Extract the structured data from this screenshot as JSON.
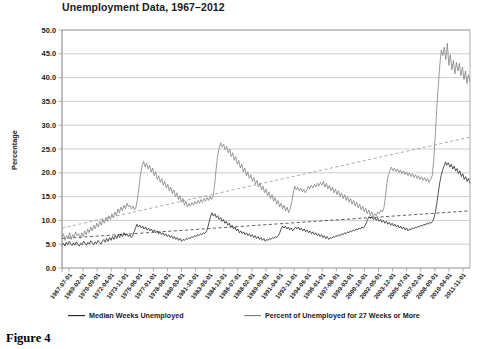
{
  "figure": {
    "caption": "Figure 4"
  },
  "chart_data": {
    "type": "line",
    "title": "Unemployment Data, 1967–2012",
    "xlabel": "",
    "ylabel": "Percentage",
    "ylim": [
      0.0,
      50.0
    ],
    "yticks": [
      "0.0",
      "5.0",
      "10.0",
      "15.0",
      "20.0",
      "25.0",
      "30.0",
      "35.0",
      "40.0",
      "45.0",
      "50.0"
    ],
    "ytick_values": [
      0,
      5,
      10,
      15,
      20,
      25,
      30,
      35,
      40,
      45,
      50
    ],
    "grid": true,
    "legend_position": "bottom",
    "legend": [
      "Median Weeks Unemployed",
      "Percent of Unemployed for 27 Weeks or More"
    ],
    "xtick_labels": [
      "1967-07-01",
      "1969-02-01",
      "1970-09-01",
      "1972-04-01",
      "1973-11-01",
      "1975-06-01",
      "1977-01-01",
      "1978-08-01",
      "1980-03-01",
      "1981-10-01",
      "1983-05-01",
      "1984-12-01",
      "1986-07-01",
      "1988-02-01",
      "1989-09-01",
      "1991-04-01",
      "1992-11-01",
      "1994-06-01",
      "1996-01-01",
      "1997-08-01",
      "1999-03-01",
      "2000-10-01",
      "2002-05-01",
      "2003-12-01",
      "2005-07-01",
      "2007-02-01",
      "2008-09-01",
      "2010-04-01",
      "2011-11-01"
    ],
    "xtick_interval_months": 19,
    "x_start": "1967-07-01",
    "x_end": "2012-06-01",
    "colors": {
      "median": "#1d1d1d",
      "percent": "#7b7b7b",
      "grid": "#b9b9b9"
    },
    "series": [
      {
        "name": "Median Weeks Unemployed",
        "color": "#1d1d1d",
        "trend_endpoints": [
          6.2,
          12.0
        ],
        "values": [
          4.8,
          5.2,
          4.6,
          5.4,
          4.9,
          5.6,
          5.1,
          4.7,
          5.3,
          4.8,
          5.5,
          5.0,
          4.6,
          5.2,
          4.9,
          5.6,
          5.2,
          4.8,
          5.4,
          5.0,
          5.7,
          5.3,
          4.9,
          5.5,
          5.1,
          5.8,
          5.4,
          5.0,
          5.6,
          6.0,
          5.4,
          6.2,
          5.6,
          6.4,
          5.8,
          6.6,
          6.0,
          6.8,
          6.2,
          7.0,
          6.4,
          7.2,
          6.6,
          7.4,
          6.8,
          7.2,
          6.6,
          7.0,
          6.4,
          6.8,
          7.6,
          8.4,
          9.2,
          8.6,
          9.0,
          8.4,
          8.8,
          8.2,
          8.6,
          8.0,
          8.4,
          7.8,
          8.2,
          7.6,
          8.0,
          7.4,
          7.8,
          7.2,
          7.6,
          7.0,
          7.4,
          6.8,
          7.2,
          6.6,
          7.0,
          6.4,
          6.8,
          6.2,
          6.6,
          6.0,
          6.4,
          5.8,
          6.2,
          5.6,
          6.0,
          5.8,
          6.2,
          6.0,
          6.4,
          6.2,
          6.6,
          6.4,
          6.8,
          6.6,
          7.0,
          6.8,
          7.2,
          7.0,
          7.4,
          7.2,
          7.6,
          8.4,
          9.6,
          10.8,
          11.6,
          10.9,
          11.4,
          10.6,
          11.0,
          10.2,
          10.6,
          9.8,
          10.2,
          9.4,
          9.8,
          9.0,
          9.4,
          8.6,
          9.0,
          8.2,
          8.6,
          7.8,
          8.2,
          7.4,
          7.8,
          7.2,
          7.6,
          7.0,
          7.4,
          6.8,
          7.2,
          6.6,
          7.0,
          6.4,
          6.8,
          6.2,
          6.6,
          6.0,
          6.4,
          5.8,
          6.2,
          5.6,
          6.0,
          5.8,
          6.2,
          6.0,
          6.4,
          6.2,
          6.6,
          6.4,
          6.8,
          7.4,
          8.2,
          8.8,
          8.4,
          8.8,
          8.2,
          8.6,
          8.0,
          8.4,
          7.8,
          8.2,
          8.6,
          8.2,
          8.6,
          8.0,
          8.4,
          7.8,
          8.2,
          7.6,
          8.0,
          7.4,
          7.8,
          7.2,
          7.6,
          7.0,
          7.4,
          6.8,
          7.2,
          6.6,
          7.0,
          6.4,
          6.8,
          6.2,
          6.6,
          6.0,
          6.4,
          6.2,
          6.6,
          6.4,
          6.8,
          6.6,
          7.0,
          6.8,
          7.2,
          7.0,
          7.4,
          7.2,
          7.6,
          7.4,
          7.8,
          7.6,
          8.0,
          7.8,
          8.2,
          8.0,
          8.4,
          8.2,
          8.6,
          8.4,
          8.8,
          9.4,
          10.2,
          10.8,
          10.4,
          10.8,
          10.2,
          10.6,
          10.0,
          10.4,
          9.8,
          10.2,
          9.6,
          10.0,
          9.4,
          9.8,
          9.2,
          9.6,
          9.0,
          9.4,
          8.8,
          9.2,
          8.6,
          9.0,
          8.4,
          8.8,
          8.2,
          8.6,
          8.0,
          8.4,
          7.8,
          8.2,
          8.0,
          8.4,
          8.2,
          8.6,
          8.4,
          8.8,
          8.6,
          9.0,
          8.8,
          9.2,
          9.0,
          9.4,
          9.2,
          9.6,
          9.4,
          9.8,
          10.4,
          11.8,
          13.6,
          15.8,
          17.9,
          19.4,
          20.6,
          21.4,
          22.3,
          21.6,
          22.1,
          21.2,
          21.8,
          20.8,
          21.4,
          20.4,
          20.9,
          19.8,
          20.4,
          19.2,
          19.8,
          18.6,
          19.2,
          18.2,
          18.8,
          17.8
        ]
      },
      {
        "name": "Percent of Unemployed for 27 Weeks or More",
        "color": "#7b7b7b",
        "trend_endpoints": [
          8.4,
          27.5
        ],
        "values": [
          6.4,
          7.2,
          5.8,
          6.8,
          6.2,
          7.4,
          6.0,
          7.0,
          6.4,
          7.6,
          6.8,
          7.2,
          6.2,
          7.4,
          6.6,
          7.8,
          7.0,
          8.2,
          7.4,
          8.6,
          7.8,
          9.0,
          8.2,
          9.4,
          8.6,
          9.8,
          9.0,
          10.2,
          9.4,
          10.6,
          9.8,
          11.0,
          10.2,
          11.4,
          10.6,
          11.8,
          11.0,
          12.4,
          11.6,
          12.8,
          12.0,
          13.2,
          12.4,
          13.6,
          12.8,
          13.2,
          12.4,
          13.0,
          12.2,
          12.8,
          14.6,
          17.2,
          19.8,
          21.4,
          22.4,
          21.2,
          22.0,
          20.8,
          21.6,
          20.2,
          21.0,
          19.4,
          20.2,
          18.6,
          19.4,
          18.0,
          18.8,
          17.4,
          18.2,
          16.8,
          17.6,
          16.2,
          17.0,
          15.6,
          16.4,
          15.0,
          15.8,
          14.4,
          15.2,
          13.8,
          14.6,
          13.2,
          14.0,
          12.8,
          13.6,
          13.0,
          13.8,
          13.2,
          14.0,
          13.4,
          14.2,
          13.6,
          14.4,
          13.8,
          14.6,
          14.0,
          14.8,
          14.2,
          15.0,
          14.4,
          15.2,
          17.4,
          20.8,
          23.6,
          25.2,
          26.3,
          25.4,
          26.0,
          24.8,
          25.6,
          24.2,
          25.0,
          23.4,
          24.2,
          22.6,
          23.4,
          21.8,
          22.6,
          21.0,
          21.8,
          20.2,
          21.0,
          19.4,
          20.2,
          18.8,
          19.6,
          18.2,
          19.0,
          17.6,
          18.4,
          17.0,
          17.8,
          16.4,
          17.2,
          15.8,
          16.6,
          15.2,
          16.0,
          14.6,
          15.4,
          14.0,
          14.8,
          13.4,
          14.2,
          12.8,
          13.6,
          12.4,
          13.2,
          12.0,
          12.8,
          11.6,
          12.4,
          13.8,
          15.6,
          17.2,
          16.4,
          17.0,
          16.2,
          16.8,
          16.0,
          16.6,
          15.8,
          16.4,
          17.2,
          16.6,
          17.4,
          16.8,
          17.6,
          17.0,
          17.8,
          17.2,
          18.0,
          17.4,
          18.2,
          17.0,
          17.8,
          16.6,
          17.4,
          16.2,
          17.0,
          15.8,
          16.6,
          15.4,
          16.2,
          15.0,
          15.8,
          14.6,
          15.4,
          14.2,
          15.0,
          13.8,
          14.6,
          13.4,
          14.2,
          13.0,
          13.8,
          12.6,
          13.4,
          12.2,
          13.0,
          11.8,
          12.6,
          11.4,
          12.2,
          11.0,
          11.8,
          10.6,
          11.4,
          11.0,
          11.8,
          11.4,
          12.2,
          11.8,
          12.6,
          14.8,
          17.8,
          19.6,
          20.4,
          21.2,
          20.4,
          21.0,
          20.2,
          20.8,
          20.0,
          20.6,
          19.8,
          20.4,
          19.6,
          20.2,
          19.4,
          20.0,
          19.2,
          19.8,
          19.0,
          19.6,
          18.8,
          19.4,
          18.6,
          19.2,
          18.4,
          19.0,
          18.2,
          18.8,
          18.0,
          18.6,
          19.4,
          22.6,
          27.8,
          33.4,
          38.2,
          42.6,
          45.8,
          44.6,
          46.4,
          43.8,
          47.2,
          42.6,
          44.8,
          41.6,
          43.6,
          40.8,
          43.2,
          41.4,
          43.0,
          40.4,
          42.2,
          39.6,
          41.4,
          38.8,
          40.6,
          39.2
        ]
      }
    ]
  }
}
